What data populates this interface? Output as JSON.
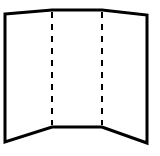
{
  "diagram": {
    "title": "Tri-fold display board",
    "stroke_color": "#000000",
    "background": "#ffffff",
    "outline_width": 3,
    "fold_width": 2,
    "fold_dash": "6 6",
    "panels": [
      {
        "name": "left-panel",
        "points": [
          [
            5,
            14
          ],
          [
            52,
            10
          ],
          [
            52,
            127
          ],
          [
            5,
            142
          ]
        ]
      },
      {
        "name": "center-panel",
        "points": [
          [
            52,
            10
          ],
          [
            102,
            10
          ],
          [
            102,
            127
          ],
          [
            52,
            127
          ]
        ]
      },
      {
        "name": "right-panel",
        "points": [
          [
            102,
            10
          ],
          [
            147,
            15
          ],
          [
            147,
            143
          ],
          [
            102,
            127
          ]
        ]
      }
    ],
    "fold_lines": [
      {
        "name": "left-fold",
        "x": 52,
        "y1": 10,
        "y2": 127
      },
      {
        "name": "right-fold",
        "x": 102,
        "y1": 10,
        "y2": 127
      }
    ]
  }
}
